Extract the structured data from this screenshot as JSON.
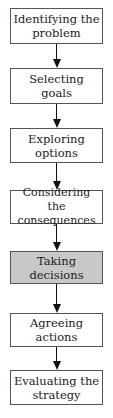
{
  "diagram": {
    "type": "flowchart",
    "direction": "top-to-bottom",
    "highlight_color": "#c8c8c8",
    "steps": [
      {
        "label": "Identifying the problem",
        "highlighted": false
      },
      {
        "label": "Selecting goals",
        "highlighted": false
      },
      {
        "label": "Exploring options",
        "highlighted": false
      },
      {
        "label": "Considering the consequences",
        "highlighted": false
      },
      {
        "label": "Taking decisions",
        "highlighted": true
      },
      {
        "label": "Agreeing actions",
        "highlighted": false
      },
      {
        "label": "Evaluating the strategy",
        "highlighted": false
      }
    ]
  }
}
